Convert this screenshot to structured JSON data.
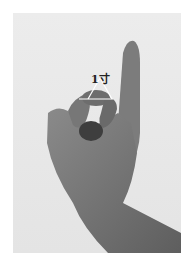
{
  "figure": {
    "annotation_label": "1寸",
    "colors": {
      "background": "#e9e9e9",
      "skin_dark": "#5a5a5a",
      "skin_mid": "#7a7a7a",
      "skin_light": "#9a9a9a",
      "marker": "#ffffff"
    }
  }
}
